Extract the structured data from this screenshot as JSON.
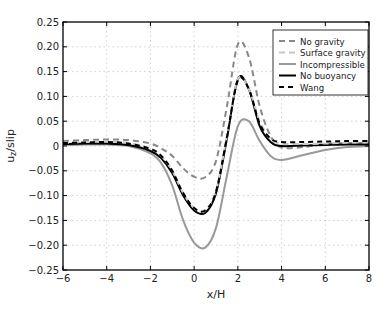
{
  "chart_data": {
    "type": "line",
    "title": "",
    "xlabel": "x/H",
    "ylabel": "u_z/slip",
    "xlim": [
      -6,
      8
    ],
    "ylim": [
      -0.25,
      0.25
    ],
    "xticks": [
      -6,
      -4,
      -2,
      0,
      2,
      4,
      6,
      8
    ],
    "yticks": [
      0.25,
      0.2,
      0.15,
      0.1,
      0.05,
      0,
      -0.05,
      -0.1,
      -0.15,
      -0.2,
      -0.25
    ],
    "xtick_labels": [
      "-6",
      "-4",
      "-2",
      "0",
      "2",
      "4",
      "6",
      "8"
    ],
    "ytick_labels": [
      "0.25",
      "0.20",
      "0.15",
      "0.10",
      "0.05",
      "0",
      "-0.05",
      "-0.10",
      "-0.15",
      "-0.20",
      "-0.25"
    ],
    "grid": true,
    "legend_position": "upper right",
    "x": [
      -6,
      -5,
      -4,
      -3,
      -2,
      -1.5,
      -1,
      -0.5,
      0,
      0.5,
      1,
      1.5,
      2,
      2.5,
      3,
      3.5,
      4,
      5,
      6,
      7,
      8
    ],
    "series": [
      {
        "name": "No gravity",
        "style": "dashed",
        "color": "#888888",
        "values": [
          0.01,
          0.012,
          0.013,
          0.012,
          0.005,
          -0.005,
          -0.02,
          -0.045,
          -0.062,
          -0.063,
          -0.03,
          0.08,
          0.205,
          0.18,
          0.08,
          0.02,
          -0.003,
          -0.002,
          0.004,
          0.006,
          0.006
        ]
      },
      {
        "name": "Surface gravity",
        "style": "dashed",
        "color": "#c8c8c8",
        "values": [
          0.006,
          0.008,
          0.009,
          0.006,
          -0.005,
          -0.02,
          -0.05,
          -0.095,
          -0.125,
          -0.13,
          -0.09,
          0.02,
          0.135,
          0.115,
          0.05,
          0.015,
          0.005,
          0.004,
          0.005,
          0.007,
          0.008
        ]
      },
      {
        "name": "Incompressible",
        "style": "solid",
        "color": "#999999",
        "values": [
          0.002,
          0.003,
          0.003,
          0.0,
          -0.015,
          -0.035,
          -0.08,
          -0.15,
          -0.195,
          -0.205,
          -0.165,
          -0.06,
          0.04,
          0.05,
          0.01,
          -0.02,
          -0.028,
          -0.018,
          -0.008,
          -0.002,
          0.0
        ]
      },
      {
        "name": "No buoyancy",
        "style": "solid",
        "color": "#000000",
        "values": [
          0.004,
          0.005,
          0.005,
          0.002,
          -0.01,
          -0.025,
          -0.055,
          -0.1,
          -0.13,
          -0.135,
          -0.095,
          0.015,
          0.135,
          0.115,
          0.04,
          0.008,
          0.0,
          0.001,
          0.002,
          0.003,
          0.003
        ]
      },
      {
        "name": "Wang",
        "style": "dashed",
        "color": "#000000",
        "values": [
          0.006,
          0.007,
          0.008,
          0.005,
          -0.006,
          -0.02,
          -0.05,
          -0.095,
          -0.125,
          -0.13,
          -0.092,
          0.018,
          0.132,
          0.115,
          0.045,
          0.015,
          0.008,
          0.008,
          0.009,
          0.01,
          0.01
        ]
      }
    ]
  },
  "legend": {
    "items": [
      {
        "label": "No gravity"
      },
      {
        "label": "Surface gravity"
      },
      {
        "label": "Incompressible"
      },
      {
        "label": "No buoyancy"
      },
      {
        "label": "Wang"
      }
    ]
  }
}
